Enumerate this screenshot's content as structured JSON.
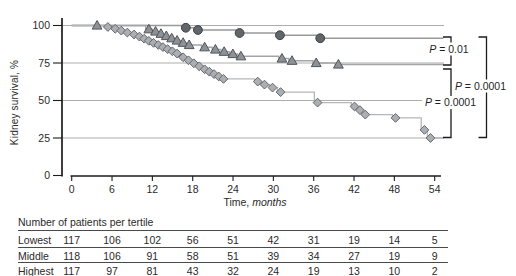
{
  "chart_data": {
    "type": "line",
    "subtype": "kaplan-meier-step",
    "ylabel": "Kidney survival, %",
    "xlabel_plain": "Time,",
    "xlabel_italic": "months",
    "xlim": [
      0,
      55.5
    ],
    "ylim": [
      0,
      100
    ],
    "xticks": [
      0,
      6,
      12,
      18,
      24,
      30,
      36,
      42,
      48,
      54
    ],
    "yticks": [
      100,
      75,
      50,
      25,
      0
    ],
    "grid": "horizontal",
    "end_month": 55.3,
    "series": [
      {
        "name": "tertile-curve-circles",
        "marker": "circle",
        "fill": "#61666a",
        "stroke": "#3c4043",
        "line": "#97999b",
        "points": [
          [
            16.5,
            98.5
          ],
          [
            18.3,
            97
          ],
          [
            24.5,
            95
          ],
          [
            30.5,
            93.5
          ],
          [
            36.5,
            91.5
          ]
        ]
      },
      {
        "name": "tertile-curve-triangles",
        "marker": "triangle",
        "fill": "#8d9296",
        "stroke": "#515559",
        "line": "#a2a5a7",
        "points": [
          [
            3.3,
            100
          ],
          [
            11,
            97.5
          ],
          [
            12,
            96
          ],
          [
            12.8,
            94.5
          ],
          [
            13.6,
            93
          ],
          [
            14.4,
            91.5
          ],
          [
            15.2,
            90
          ],
          [
            16.1,
            88.5
          ],
          [
            17,
            87
          ],
          [
            19.3,
            85.5
          ],
          [
            20.9,
            84
          ],
          [
            22.2,
            82.5
          ],
          [
            23.5,
            81
          ],
          [
            24.7,
            79.5
          ],
          [
            30.8,
            78
          ],
          [
            32.3,
            76.5
          ],
          [
            35.9,
            75
          ],
          [
            39.2,
            74
          ]
        ]
      },
      {
        "name": "tertile-curve-diamonds",
        "marker": "diamond",
        "fill": "#abafb3",
        "stroke": "#66696d",
        "line": "#b4b7b9",
        "points": [
          [
            4.9,
            99
          ],
          [
            6,
            97.8
          ],
          [
            6.9,
            96.6
          ],
          [
            7.8,
            95.3
          ],
          [
            8.8,
            94
          ],
          [
            9.6,
            92.6
          ],
          [
            10.3,
            91.2
          ],
          [
            11,
            89.8
          ],
          [
            11.7,
            88.4
          ],
          [
            12.4,
            87
          ],
          [
            13.1,
            85.6
          ],
          [
            13.8,
            84.2
          ],
          [
            14.5,
            82.8
          ],
          [
            15.2,
            81.3
          ],
          [
            16.1,
            78.8
          ],
          [
            16.9,
            76.8
          ],
          [
            17.7,
            74.8
          ],
          [
            18.5,
            72.8
          ],
          [
            19.3,
            70.8
          ],
          [
            20,
            69.2
          ],
          [
            20.7,
            67.6
          ],
          [
            21.4,
            66
          ],
          [
            22.1,
            64.4
          ],
          [
            27.2,
            62.6
          ],
          [
            28.2,
            60.6
          ],
          [
            29.4,
            58.6
          ],
          [
            30.6,
            55.6
          ],
          [
            36.1,
            48.6
          ],
          [
            41.6,
            46
          ],
          [
            42.4,
            43.6
          ],
          [
            43.2,
            40.6
          ],
          [
            47.7,
            38.4
          ],
          [
            52,
            30.4
          ],
          [
            52.9,
            25
          ]
        ]
      }
    ],
    "pvalues": [
      {
        "text": "P = 0.01",
        "from_series": 0,
        "to_series": 1
      },
      {
        "text": "P = 0.0001",
        "from_series": 1,
        "to_series": 2
      },
      {
        "text": "P = 0.0001",
        "from_series": 0,
        "to_series": 2
      }
    ],
    "colors": {
      "gridline": "#adadad",
      "axis": "#1c1c1c",
      "bracket": "#1c1c1c"
    }
  },
  "table": {
    "title": "Number of patients per tertile",
    "columns_months": [
      0,
      6,
      12,
      18,
      24,
      30,
      36,
      42,
      48,
      54
    ],
    "rows": [
      {
        "label": "Lowest",
        "values": [
          117,
          106,
          102,
          56,
          51,
          42,
          31,
          19,
          14,
          5
        ]
      },
      {
        "label": "Middle",
        "values": [
          118,
          106,
          91,
          58,
          51,
          39,
          34,
          27,
          19,
          9
        ]
      },
      {
        "label": "Highest",
        "values": [
          117,
          97,
          81,
          43,
          32,
          24,
          19,
          13,
          10,
          2
        ]
      }
    ]
  }
}
